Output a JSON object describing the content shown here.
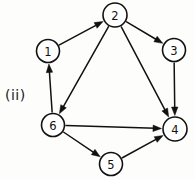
{
  "figure": {
    "caption": "(ii)",
    "caption_x": 5,
    "caption_y": 87,
    "width": 195,
    "height": 180,
    "background_color": "#fdfdfc",
    "ink_color": "#111111"
  },
  "chart_data": {
    "type": "diagram",
    "diagram_kind": "directed-graph",
    "title": "(ii)",
    "node_radius": 11.5,
    "nodes": [
      {
        "id": "1",
        "label": "1",
        "x": 48,
        "y": 51,
        "r": 11.5
      },
      {
        "id": "2",
        "label": "2",
        "x": 115,
        "y": 15,
        "r": 12.0
      },
      {
        "id": "3",
        "label": "3",
        "x": 174,
        "y": 50,
        "r": 11.5
      },
      {
        "id": "4",
        "label": "4",
        "x": 175,
        "y": 129,
        "r": 12.0
      },
      {
        "id": "5",
        "label": "5",
        "x": 111,
        "y": 164,
        "r": 11.5
      },
      {
        "id": "6",
        "label": "6",
        "x": 53,
        "y": 125,
        "r": 11.5
      }
    ],
    "edges": [
      {
        "from": "1",
        "to": "2",
        "directed": true
      },
      {
        "from": "2",
        "to": "3",
        "directed": true
      },
      {
        "from": "2",
        "to": "6",
        "directed": true
      },
      {
        "from": "2",
        "to": "4",
        "directed": true
      },
      {
        "from": "3",
        "to": "4",
        "directed": true
      },
      {
        "from": "6",
        "to": "1",
        "directed": true
      },
      {
        "from": "6",
        "to": "4",
        "directed": true
      },
      {
        "from": "6",
        "to": "5",
        "directed": true
      },
      {
        "from": "5",
        "to": "4",
        "directed": true
      }
    ],
    "in_degree": {
      "1": 1,
      "2": 1,
      "3": 1,
      "4": 4,
      "5": 1,
      "6": 1
    },
    "out_degree": {
      "1": 1,
      "2": 3,
      "3": 1,
      "4": 0,
      "5": 1,
      "6": 3
    },
    "sink_nodes": [
      "4"
    ],
    "edge_count": 9,
    "node_count": 6
  }
}
